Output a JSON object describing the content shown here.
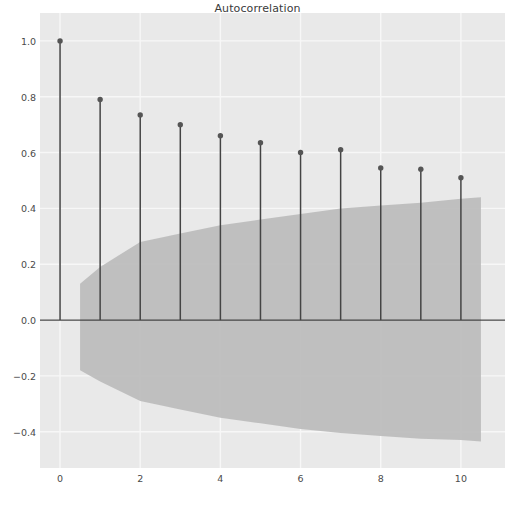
{
  "chart_data": {
    "type": "scatter",
    "subtype": "stem-acf",
    "title": "Autocorrelation",
    "xlabel": "",
    "ylabel": "",
    "x": [
      0,
      1,
      2,
      3,
      4,
      5,
      6,
      7,
      8,
      9,
      10
    ],
    "values": [
      1.0,
      0.79,
      0.735,
      0.7,
      0.66,
      0.635,
      0.6,
      0.61,
      0.545,
      0.54,
      0.51
    ],
    "series": [
      {
        "name": "Autocorrelation",
        "values": [
          1.0,
          0.79,
          0.735,
          0.7,
          0.66,
          0.635,
          0.6,
          0.61,
          0.545,
          0.54,
          0.51
        ]
      }
    ],
    "confidence_band": {
      "name": "95% confidence interval",
      "x": [
        0.5,
        1,
        2,
        3,
        4,
        5,
        6,
        7,
        8,
        9,
        10,
        10.5
      ],
      "upper": [
        0.13,
        0.19,
        0.28,
        0.31,
        0.34,
        0.36,
        0.38,
        0.4,
        0.41,
        0.42,
        0.435,
        0.44
      ],
      "lower": [
        -0.18,
        -0.22,
        -0.29,
        -0.32,
        -0.35,
        -0.37,
        -0.39,
        -0.405,
        -0.415,
        -0.425,
        -0.43,
        -0.435
      ]
    },
    "xlim": [
      -0.5,
      11.1
    ],
    "ylim": [
      -0.53,
      1.1
    ],
    "xticks": [
      0,
      2,
      4,
      6,
      8,
      10
    ],
    "xtick_labels": [
      "0",
      "2",
      "4",
      "6",
      "8",
      "10"
    ],
    "yticks": [
      1.0,
      0.8,
      0.6,
      0.4,
      0.2,
      0.0,
      -0.2,
      -0.4
    ],
    "ytick_labels": [
      "1.0",
      "0.8",
      "0.6",
      "0.4",
      "0.2",
      "0.0",
      "−0.2",
      "−0.4"
    ],
    "grid": true,
    "legend": null,
    "colors": {
      "plot_background": "#e9e9e9",
      "figure_background": "#ffffff",
      "grid": "#f7f7f7",
      "stem_line": "#444444",
      "marker": "#555555",
      "band_fill": "#bdbdbd",
      "zero_line": "#444444",
      "tick_text": "#4a4a4a",
      "title_text": "#3b3b3b"
    }
  }
}
